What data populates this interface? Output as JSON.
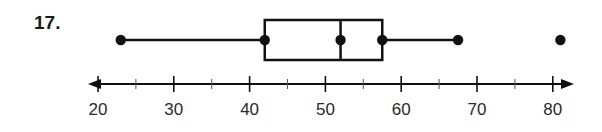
{
  "problem": {
    "number": "17."
  },
  "chart_data": {
    "type": "boxplot",
    "title": "",
    "xlabel": "",
    "ylabel": "",
    "axis": {
      "min": 20,
      "max": 80,
      "major_ticks": [
        20,
        30,
        40,
        50,
        60,
        70,
        80
      ],
      "minor_ticks": [
        25,
        35,
        45,
        55,
        65,
        75
      ],
      "tick_labels": [
        "20",
        "30",
        "40",
        "50",
        "60",
        "70",
        "80"
      ],
      "arrows_both_ends": true,
      "grid": false
    },
    "box": {
      "min": 23,
      "q1": 42,
      "median": 52,
      "q3": 57.5,
      "max_whisker": 67.5,
      "outliers": [
        81
      ]
    },
    "colors": {
      "ink": "#111111",
      "background": "#ffffff"
    }
  },
  "layout": {
    "px_per_unit": 7.58,
    "x_at_20": 98,
    "axis_y": 84,
    "box_top": 20,
    "box_bottom": 60,
    "box_mid_y": 40,
    "axis_left_end": 88,
    "axis_right_end": 574
  }
}
